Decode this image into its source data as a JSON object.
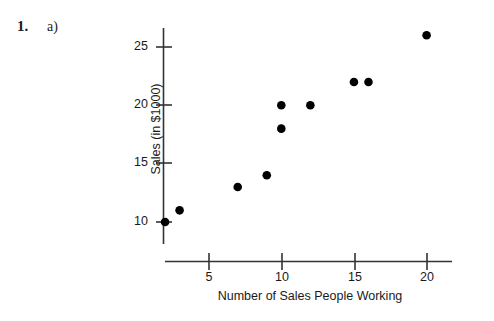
{
  "problem": {
    "number": "1.",
    "part": "a)"
  },
  "chart_data": {
    "type": "scatter",
    "title": "",
    "xlabel": "Number of Sales People Working",
    "ylabel": "Sales (in $1000)",
    "xlim": [
      0,
      21
    ],
    "ylim": [
      8.5,
      27.5
    ],
    "xticks": [
      5,
      10,
      15,
      20
    ],
    "xtick_labels": [
      "5",
      "10",
      "15",
      "20"
    ],
    "yticks": [
      10,
      15,
      20,
      25
    ],
    "ytick_labels": [
      "10",
      "15",
      "20",
      "25"
    ],
    "grid": false,
    "legend": "none",
    "marker": "filled-circle",
    "marker_color": "#000000",
    "axis_color": "#333333",
    "points": [
      {
        "x": 2,
        "y": 10
      },
      {
        "x": 3,
        "y": 11
      },
      {
        "x": 7,
        "y": 13
      },
      {
        "x": 9,
        "y": 14
      },
      {
        "x": 10,
        "y": 20
      },
      {
        "x": 10,
        "y": 18
      },
      {
        "x": 12,
        "y": 20
      },
      {
        "x": 15,
        "y": 22
      },
      {
        "x": 16,
        "y": 22
      },
      {
        "x": 20,
        "y": 26
      }
    ],
    "x": [
      2,
      3,
      7,
      9,
      10,
      10,
      12,
      15,
      16,
      20
    ],
    "values": [
      10,
      11,
      13,
      14,
      20,
      18,
      20,
      22,
      22,
      26
    ]
  }
}
